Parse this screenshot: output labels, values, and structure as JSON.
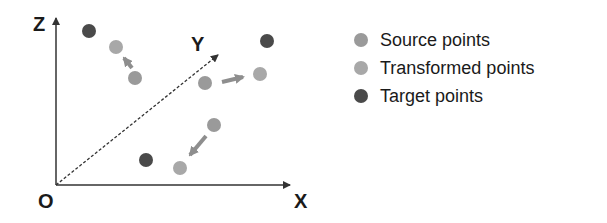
{
  "axes": {
    "z_label": "Z",
    "y_label": "Y",
    "x_label": "X",
    "origin_label": "O"
  },
  "legend": [
    {
      "label": "Source points",
      "color": "#9a9a9a"
    },
    {
      "label": "Transformed points",
      "color": "#a8a8a8"
    },
    {
      "label": "Target points",
      "color": "#4a4a4a"
    }
  ],
  "colors": {
    "source": "#9a9a9a",
    "transformed": "#a8a8a8",
    "target": "#4a4a4a",
    "arrow": "#8e8e8e",
    "axis": "#333333"
  },
  "points": {
    "source": [
      [
        135,
        78
      ],
      [
        205,
        83
      ],
      [
        214,
        125
      ]
    ],
    "transformed": [
      [
        116,
        47
      ],
      [
        260,
        74
      ],
      [
        180,
        168
      ]
    ],
    "target": [
      [
        89,
        31
      ],
      [
        267,
        41
      ],
      [
        146,
        160
      ]
    ]
  }
}
